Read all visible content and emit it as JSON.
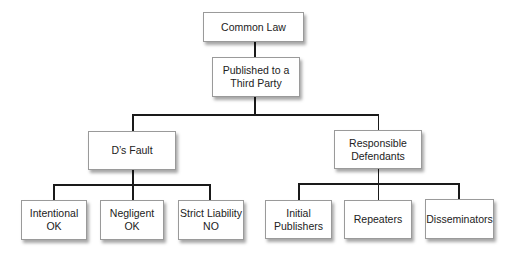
{
  "diagram": {
    "type": "tree",
    "line_color": "#1a1a1a",
    "root": {
      "id": "common-law",
      "label": "Common Law"
    },
    "level1": {
      "id": "published",
      "label": "Published to a\nThird Party"
    },
    "branches": [
      {
        "id": "ds-fault",
        "label": "D’s Fault",
        "children": [
          {
            "id": "intentional",
            "label": "Intentional\nOK"
          },
          {
            "id": "negligent",
            "label": "Negligent\nOK"
          },
          {
            "id": "strict-liability",
            "label": "Strict Liability\nNO"
          }
        ]
      },
      {
        "id": "responsible-defendants",
        "label": "Responsible\nDefendants",
        "children": [
          {
            "id": "initial-publishers",
            "label": "Initial\nPublishers"
          },
          {
            "id": "repeaters",
            "label": "Repeaters"
          },
          {
            "id": "disseminators",
            "label": "Disseminators"
          }
        ]
      }
    ]
  }
}
